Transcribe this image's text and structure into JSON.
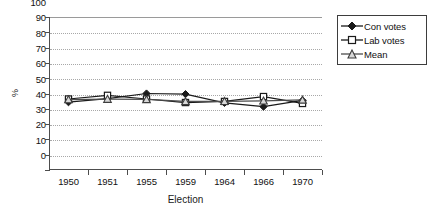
{
  "chart_data": {
    "type": "line",
    "title": "",
    "xlabel": "Election",
    "ylabel": "%",
    "categories": [
      "1950",
      "1951",
      "1955",
      "1959",
      "1964",
      "1966",
      "1970"
    ],
    "ylim": [
      0,
      100
    ],
    "yticks": [
      0,
      10,
      20,
      30,
      40,
      50,
      60,
      70,
      80,
      90,
      100
    ],
    "ytick_labels": [
      "0",
      "10",
      "20",
      "30",
      "40",
      "50",
      "60",
      "70",
      "80",
      "90",
      "100"
    ],
    "grid": "horizontal-dotted",
    "legend_position": "right-top",
    "series": [
      {
        "name": "Con votes",
        "marker": "filled-diamond",
        "color": "#1a1a1a",
        "values": [
          44.3,
          46.6,
          50.0,
          49.6,
          43.9,
          41.4,
          45.5
        ]
      },
      {
        "name": "Lab votes",
        "marker": "open-square",
        "color": "#1a1a1a",
        "values": [
          46.4,
          48.8,
          46.4,
          44.1,
          44.8,
          48.0,
          43.5
        ]
      },
      {
        "name": "Mean",
        "marker": "open-triangle",
        "color": "#4d4d4d",
        "values": [
          46.0,
          46.3,
          46.1,
          44.8,
          44.9,
          45.2,
          45.8
        ]
      }
    ]
  },
  "legend": {
    "items": [
      {
        "label": "Con votes"
      },
      {
        "label": "Lab votes"
      },
      {
        "label": "Mean"
      }
    ]
  },
  "axes": {
    "y_title": "%",
    "x_title": "Election"
  }
}
